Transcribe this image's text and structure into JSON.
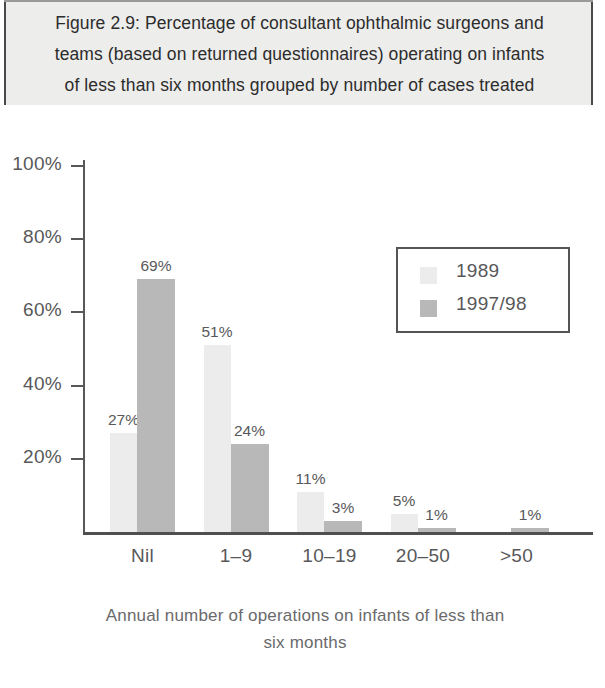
{
  "figure": {
    "title": "Figure 2.9: Percentage of consultant ophthalmic surgeons and\nteams (based on returned questionnaires) operating on infants\nof less than six months grouped by number of cases treated"
  },
  "chart_data": {
    "type": "bar",
    "title": "Figure 2.9: Percentage of consultant ophthalmic surgeons and teams (based on returned questionnaires) operating on infants of less than six months grouped by number of cases treated",
    "xlabel": "Annual number of operations on infants of less than six months",
    "ylabel": "",
    "categories": [
      "Nil",
      "1–9",
      "10–19",
      "20–50",
      ">50"
    ],
    "series": [
      {
        "name": "1989",
        "values": [
          27,
          51,
          11,
          5,
          0
        ],
        "color": "#ececec"
      },
      {
        "name": "1997/98",
        "values": [
          69,
          24,
          3,
          1,
          1
        ],
        "color": "#b8b8b8"
      }
    ],
    "value_labels": [
      [
        "27%",
        "51%",
        "11%",
        "5%",
        ""
      ],
      [
        "69%",
        "24%",
        "3%",
        "1%",
        "1%"
      ]
    ],
    "ylim": [
      0,
      100
    ],
    "ytick_values": [
      20,
      40,
      60,
      80,
      100
    ],
    "ytick_labels": [
      "20%",
      "40%",
      "60%",
      "80%",
      "100%"
    ],
    "grid": false,
    "legend_position": "upper right"
  },
  "axes": {
    "x_axis_title": "Annual number of operations on infants of less than\nsix months",
    "y_ticks": [
      {
        "label": "100%",
        "value": 100
      },
      {
        "label": "80%",
        "value": 80
      },
      {
        "label": "60%",
        "value": 60
      },
      {
        "label": "40%",
        "value": 40
      },
      {
        "label": "20%",
        "value": 20
      }
    ],
    "categories": [
      {
        "label": "Nil"
      },
      {
        "label": "1–9"
      },
      {
        "label": "10–19"
      },
      {
        "label": "20–50"
      },
      {
        "label": ">50"
      }
    ]
  },
  "legend": {
    "entries": [
      {
        "label": "1989",
        "color": "#ececec"
      },
      {
        "label": "1997/98",
        "color": "#b8b8b8"
      }
    ]
  },
  "bars": [
    {
      "group": "Nil",
      "series": "1989",
      "value": 27,
      "label": "27%",
      "color": "#ececec"
    },
    {
      "group": "Nil",
      "series": "1997/98",
      "value": 69,
      "label": "69%",
      "color": "#b8b8b8"
    },
    {
      "group": "1–9",
      "series": "1989",
      "value": 51,
      "label": "51%",
      "color": "#ececec"
    },
    {
      "group": "1–9",
      "series": "1997/98",
      "value": 24,
      "label": "24%",
      "color": "#b8b8b8"
    },
    {
      "group": "10–19",
      "series": "1989",
      "value": 11,
      "label": "11%",
      "color": "#ececec"
    },
    {
      "group": "10–19",
      "series": "1997/98",
      "value": 3,
      "label": "3%",
      "color": "#b8b8b8"
    },
    {
      "group": "20–50",
      "series": "1989",
      "value": 5,
      "label": "5%",
      "color": "#ececec"
    },
    {
      "group": "20–50",
      "series": "1997/98",
      "value": 1,
      "label": "1%",
      "color": "#b8b8b8"
    },
    {
      "group": ">50",
      "series": "1997/98",
      "value": 1,
      "label": "1%",
      "color": "#b8b8b8"
    }
  ]
}
